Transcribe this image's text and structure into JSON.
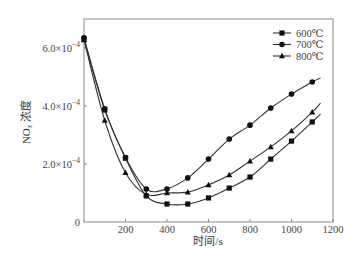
{
  "chart_data": {
    "type": "line",
    "title": "",
    "xlabel": "时间/s",
    "ylabel": "NOx 浓度",
    "ylabel_parts": {
      "main": "NO",
      "sub": "x",
      "rest": " 浓度"
    },
    "xlim": [
      0,
      1200
    ],
    "ylim": [
      0,
      0.00065
    ],
    "grid": false,
    "legend_position": "upper right",
    "x_ticks": [
      {
        "value": 200,
        "label": "200"
      },
      {
        "value": 400,
        "label": "400"
      },
      {
        "value": 600,
        "label": "600"
      },
      {
        "value": 800,
        "label": "800"
      },
      {
        "value": 1000,
        "label": "1000"
      },
      {
        "value": 1200,
        "label": "1200"
      }
    ],
    "y_ticks": [
      {
        "value": 0,
        "label": "0",
        "mant": "0",
        "exp": ""
      },
      {
        "value": 0.0002,
        "label": "2.0×10⁻⁴",
        "mant": "2.0×10",
        "exp": "−4"
      },
      {
        "value": 0.0004,
        "label": "4.0×10⁻⁴",
        "mant": "4.0×10",
        "exp": "−4"
      },
      {
        "value": 0.0006,
        "label": "6.0×10⁻⁴",
        "mant": "6.0×10",
        "exp": "−4"
      }
    ],
    "x": [
      0,
      100,
      200,
      300,
      400,
      500,
      600,
      700,
      800,
      900,
      1000,
      1100
    ],
    "series": [
      {
        "name": "600℃",
        "marker": "square",
        "values": [
          0.00063,
          0.000386,
          0.00022,
          9e-05,
          6.2e-05,
          6.2e-05,
          8.3e-05,
          0.000117,
          0.000155,
          0.000217,
          0.000279,
          0.000345
        ],
        "end_x": 1140,
        "end_value": 0.000372
      },
      {
        "name": "700℃",
        "marker": "circle",
        "values": [
          0.000635,
          0.00039,
          0.000222,
          0.000114,
          0.000114,
          0.000152,
          0.000217,
          0.000286,
          0.000334,
          0.000393,
          0.000441,
          0.000483
        ],
        "end_x": 1140,
        "end_value": 0.000497
      },
      {
        "name": "800℃",
        "marker": "triangle",
        "values": [
          0.000628,
          0.00035,
          0.00017,
          9.5e-05,
          0.0001,
          0.000103,
          0.000128,
          0.000162,
          0.00021,
          0.000259,
          0.000314,
          0.000379
        ],
        "end_x": 1140,
        "end_value": 0.00041
      }
    ]
  }
}
